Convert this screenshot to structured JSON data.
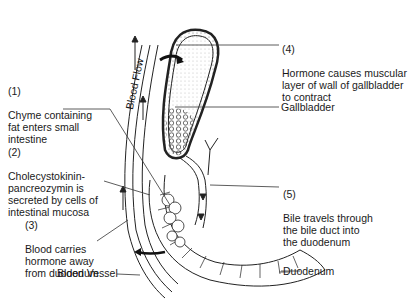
{
  "labels": {
    "step1": {
      "num": "(1)",
      "text": "Chyme containing\nfat enters small\nintestine"
    },
    "step2": {
      "num": "(2)",
      "text": "Cholecystokinin-\npancreozymin is\nsecreted by cells of\nintestinal mucosa"
    },
    "step3": {
      "num": "(3)",
      "text": "Blood carries\nhormone away\nfrom duodenum"
    },
    "step4": {
      "num": "(4)",
      "text": "Hormone causes muscular\nlayer of wall of gallbladder\nto contract"
    },
    "step5": {
      "num": "(5)",
      "text": "Bile travels through\nthe bile duct into\nthe duodenum"
    },
    "gallbladder": "Gallbladder",
    "duodenum": "Duodenum",
    "blood_vessel": "Blood Vessel",
    "blood_flow": "Blood Flow"
  }
}
